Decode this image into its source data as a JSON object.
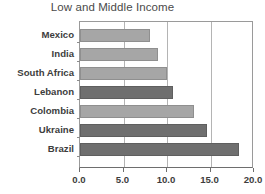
{
  "chart_data": {
    "type": "bar",
    "orientation": "horizontal",
    "title": "Low and Middle Income",
    "xlabel": "",
    "ylabel": "",
    "categories": [
      "Mexico",
      "India",
      "South Africa",
      "Lebanon",
      "Colombia",
      "Ukraine",
      "Brazil"
    ],
    "values": [
      8.0,
      9.0,
      10.0,
      10.7,
      13.1,
      14.6,
      18.3
    ],
    "bar_shades": [
      "light",
      "light",
      "light",
      "dark",
      "light",
      "dark",
      "dark"
    ],
    "xlim": [
      0.0,
      20.0
    ],
    "xticks": [
      0.0,
      5.0,
      10.0,
      15.0,
      20.0
    ],
    "xtick_labels": [
      "0.0",
      "5.0",
      "10.0",
      "15.0",
      "20.0"
    ],
    "gridlines": [
      5.0,
      10.0,
      15.0
    ],
    "grid": true,
    "legend": null,
    "colors": {
      "bar_light": "#a6a6a6",
      "bar_dark": "#6f6f6f",
      "grid": "#b4b4b4",
      "axis": "#6e6e6e",
      "text": "#3d3d3d",
      "title": "#4a4a4a",
      "background": "#ffffff"
    }
  }
}
